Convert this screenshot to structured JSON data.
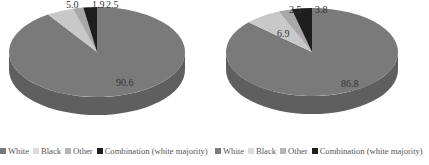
{
  "chart_data": [
    {
      "type": "pie",
      "style": "3d",
      "title": "",
      "categories": [
        "White",
        "Black",
        "Other",
        "Combination (white majority)"
      ],
      "values": [
        90.6,
        5.0,
        1.9,
        2.5
      ],
      "labels": [
        "90.6",
        "5.0",
        "1.9",
        "2.5"
      ],
      "colors": [
        "#7a7a7a",
        "#c8c8c8",
        "#a8a8a8",
        "#1e1e1e"
      ],
      "legend_position": "bottom"
    },
    {
      "type": "pie",
      "style": "3d",
      "title": "",
      "categories": [
        "White",
        "Black",
        "Other",
        "Combination (white majority)"
      ],
      "values": [
        86.8,
        6.9,
        2.5,
        3.8
      ],
      "labels": [
        "86.8",
        "6.9",
        "2.5",
        "3.8"
      ],
      "colors": [
        "#7a7a7a",
        "#c8c8c8",
        "#a8a8a8",
        "#1e1e1e"
      ],
      "legend_position": "bottom"
    }
  ],
  "legends": [
    {
      "items": [
        {
          "label": "White",
          "color": "#7a7a7a"
        },
        {
          "label": "Black",
          "color": "#d6d6d6"
        },
        {
          "label": "Other",
          "color": "#b0b0b0"
        },
        {
          "label": "Combination (white majority)",
          "color": "#1e1e1e"
        }
      ]
    },
    {
      "items": [
        {
          "label": "White",
          "color": "#7a7a7a"
        },
        {
          "label": "Black",
          "color": "#d6d6d6"
        },
        {
          "label": "Other",
          "color": "#b0b0b0"
        },
        {
          "label": "Combination (white majority)",
          "color": "#1e1e1e"
        }
      ]
    }
  ]
}
